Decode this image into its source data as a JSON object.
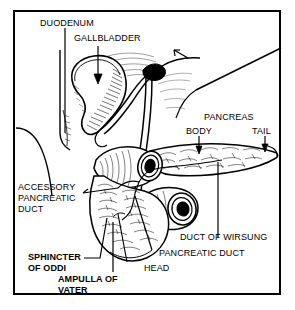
{
  "figure": {
    "style": "black-and-white line engraving with cross-hatching",
    "border_color": "#000000",
    "ink_color": "#000000",
    "background_color": "#ffffff"
  },
  "labels": {
    "duodenum": "DUODENUM",
    "gallbladder": "GALLBLADDER",
    "pancreas": "PANCREAS",
    "body": "BODY",
    "tail": "TAIL",
    "accessory_pancreatic_duct_line1": "ACCESSORY",
    "accessory_pancreatic_duct_line2": "PANCREATIC",
    "accessory_pancreatic_duct_line3": "DUCT",
    "duct_of_wirsung": "DUCT OF WIRSUNG",
    "pancreatic_duct": "PANCREATIC DUCT",
    "head": "HEAD",
    "sphincter_of_oddi_line1": "SPHINCTER",
    "sphincter_of_oddi_line2": "OF ODDI",
    "ampulla_of_vater_line1": "AMPULLA OF",
    "ampulla_of_vater_line2": "VATER"
  },
  "label_list": [
    {
      "id": "duodenum",
      "text": "DUODENUM",
      "bold": false,
      "leader": "vertical-line"
    },
    {
      "id": "gallbladder",
      "text": "GALLBLADDER",
      "bold": false,
      "leader": "down-arrow"
    },
    {
      "id": "pancreas",
      "text": "PANCREAS",
      "bold": false,
      "leader": "none"
    },
    {
      "id": "body",
      "text": "BODY",
      "bold": false,
      "leader": "down-arrow"
    },
    {
      "id": "tail",
      "text": "TAIL",
      "bold": false,
      "leader": "down-arrow"
    },
    {
      "id": "accessory-pancreatic-duct",
      "text": "ACCESSORY PANCREATIC DUCT",
      "bold": false,
      "leader": "pointer-line"
    },
    {
      "id": "duct-of-wirsung",
      "text": "DUCT OF WIRSUNG",
      "bold": false,
      "leader": "vertical-line"
    },
    {
      "id": "pancreatic-duct",
      "text": "PANCREATIC DUCT",
      "bold": false,
      "leader": "diagonal-line"
    },
    {
      "id": "head",
      "text": "HEAD",
      "bold": false,
      "leader": "diagonal-line"
    },
    {
      "id": "sphincter-of-oddi",
      "text": "SPHINCTER OF ODDI",
      "bold": true,
      "leader": "elbow-line"
    },
    {
      "id": "ampulla-of-vater",
      "text": "AMPULLA OF VATER",
      "bold": true,
      "leader": "vertical-line"
    }
  ]
}
